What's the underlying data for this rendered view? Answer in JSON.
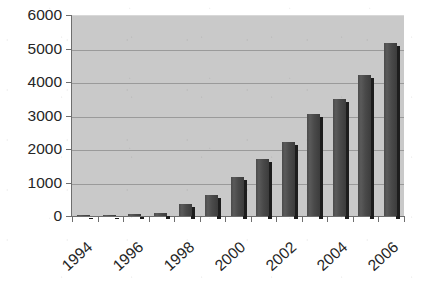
{
  "chart_data": {
    "type": "bar",
    "title": "",
    "subtitle": "",
    "xlabel": "",
    "ylabel": "",
    "grid": true,
    "legend": false,
    "ylim": [
      0,
      6000
    ],
    "ytick_step": 1000,
    "yticks": [
      "0",
      "1000",
      "2000",
      "3000",
      "4000",
      "5000",
      "6000"
    ],
    "xticks_visible": [
      "1994",
      "1996",
      "1998",
      "2000",
      "2002",
      "2004",
      "2006"
    ],
    "categories": [
      "1994",
      "1995",
      "1996",
      "1997",
      "1998",
      "1999",
      "2000",
      "2001",
      "2002",
      "2003",
      "2004",
      "2005",
      "2006"
    ],
    "values": [
      10,
      30,
      55,
      85,
      350,
      620,
      1150,
      1700,
      2200,
      3050,
      3500,
      4200,
      5150
    ],
    "colors": {
      "plot_background": "#c9c9c9",
      "bar_fill": "#4a4a4a",
      "bar_shadow": "#1d1d1d",
      "gridline": "#9a9a9a",
      "axis": "#6e6e6e",
      "text": "#262626",
      "page_background": "#ffffff"
    }
  }
}
